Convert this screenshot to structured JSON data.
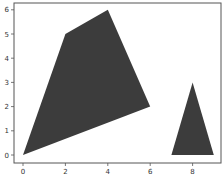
{
  "chart_data": {
    "type": "polygon",
    "title": "",
    "xlabel": "",
    "ylabel": "",
    "xlim": [
      -0.4,
      9.4
    ],
    "ylim": [
      -0.3,
      6.3
    ],
    "grid": false,
    "x_ticks": [
      "0",
      "2",
      "4",
      "6",
      "8"
    ],
    "y_ticks": [
      "0",
      "1",
      "2",
      "3",
      "4",
      "5",
      "6"
    ],
    "series": [
      {
        "name": "quadrilateral",
        "color": "#3c3c3c",
        "points": [
          [
            0,
            0
          ],
          [
            2,
            5
          ],
          [
            4,
            6
          ],
          [
            6,
            2
          ]
        ]
      },
      {
        "name": "triangle",
        "color": "#3c3c3c",
        "points": [
          [
            7,
            0
          ],
          [
            9,
            0
          ],
          [
            8,
            3
          ]
        ]
      }
    ]
  }
}
